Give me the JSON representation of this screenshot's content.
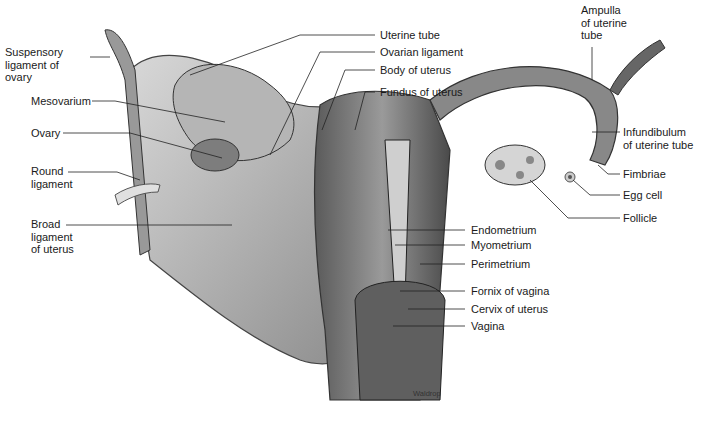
{
  "figure": {
    "credit": "Waldrop"
  },
  "labels": {
    "left": [
      {
        "id": "suspensory",
        "text": "Suspensory\nligament of\novary"
      },
      {
        "id": "mesovarium",
        "text": "Mesovarium"
      },
      {
        "id": "ovary",
        "text": "Ovary"
      },
      {
        "id": "round",
        "text": "Round\nligament"
      },
      {
        "id": "broad",
        "text": "Broad\nligament\nof uterus"
      }
    ],
    "top": [
      {
        "id": "uterine_tube",
        "text": "Uterine tube"
      },
      {
        "id": "ovarian_lig",
        "text": "Ovarian ligament"
      },
      {
        "id": "body",
        "text": "Body of uterus"
      },
      {
        "id": "fundus",
        "text": "Fundus of uterus"
      }
    ],
    "right": [
      {
        "id": "ampulla",
        "text": "Ampulla\nof uterine\ntube"
      },
      {
        "id": "infundibulum",
        "text": "Infundibulum\nof uterine tube"
      },
      {
        "id": "fimbriae",
        "text": "Fimbriae"
      },
      {
        "id": "egg",
        "text": "Egg cell"
      },
      {
        "id": "follicle",
        "text": "Follicle"
      }
    ],
    "bottom": [
      {
        "id": "endometrium",
        "text": "Endometrium"
      },
      {
        "id": "myometrium",
        "text": "Myometrium"
      },
      {
        "id": "perimetrium",
        "text": "Perimetrium"
      },
      {
        "id": "fornix",
        "text": "Fornix of vagina"
      },
      {
        "id": "cervix",
        "text": "Cervix of uterus"
      },
      {
        "id": "vagina",
        "text": "Vagina"
      }
    ]
  }
}
